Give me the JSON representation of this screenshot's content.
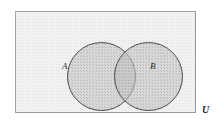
{
  "figure": {
    "kind": "venn-diagram",
    "universe": {
      "label": "U",
      "name": "universal-set"
    },
    "sets": [
      {
        "label": "A",
        "name": "set-a"
      },
      {
        "label": "B",
        "name": "set-b"
      }
    ],
    "colors": {
      "universe_fill": "#f1f1f1",
      "universe_border": "#9a9a9a",
      "circle_fill": "#c5c5c5",
      "circle_border": "#4a4a4a",
      "label_text": "#2b2b2b",
      "page_background": "#ffffff"
    }
  }
}
